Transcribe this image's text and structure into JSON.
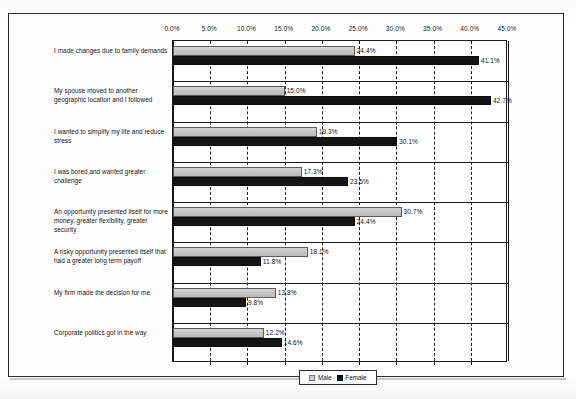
{
  "chart_data": {
    "type": "bar",
    "orientation": "horizontal",
    "title": "",
    "xlabel": "",
    "ylabel": "",
    "xlim": [
      0,
      45
    ],
    "xtick_labels": [
      "0.0%",
      "5.0%",
      "10.0%",
      "15.0%",
      "20.0%",
      "25.0%",
      "30.0%",
      "35.0%",
      "40.0%",
      "45.0%"
    ],
    "xticks": [
      0,
      5,
      10,
      15,
      20,
      25,
      30,
      35,
      40,
      45
    ],
    "grid": true,
    "grid_style": "dashed-vertical",
    "legend_position": "bottom-center",
    "categories": [
      "I made changes due to family demands",
      "My spouse moved to another geographic location and I followed",
      "I wanted to simplify my life and reduce stress",
      "I was bored and wanted greater challenge",
      "An opportunity presented itself for more money, greater flexibility, greater security",
      "A risky opportunity presented itself that had a greater long term payoff",
      "My firm made the decision for me",
      "Corporate politics got in the way"
    ],
    "series": [
      {
        "name": "Male",
        "color": "#c9c9c9",
        "values": [
          24.4,
          15.0,
          19.3,
          17.3,
          30.7,
          18.1,
          13.8,
          12.2
        ],
        "value_labels": [
          "24.4%",
          "15.0%",
          "19.3%",
          "17.3%",
          "30.7%",
          "18.1%",
          "13.8%",
          "12.2%"
        ]
      },
      {
        "name": "Female",
        "color": "#141414",
        "values": [
          41.1,
          42.7,
          30.1,
          23.5,
          24.4,
          11.8,
          9.8,
          14.6
        ],
        "value_labels": [
          "41.1%",
          "42.7%",
          "30.1%",
          "23.5%",
          "24.4%",
          "11.8%",
          "9.8%",
          "14.6%"
        ]
      }
    ]
  },
  "legend": {
    "items": [
      {
        "label": "Male",
        "swatch": "male-swatch-icon"
      },
      {
        "label": "Female",
        "swatch": "female-swatch-icon"
      }
    ]
  }
}
